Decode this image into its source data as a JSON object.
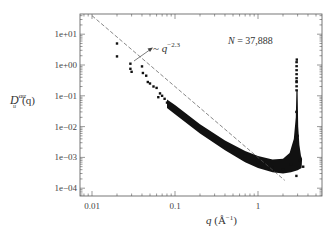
{
  "chart_data": {
    "type": "scatter",
    "title": "",
    "xlabel": "q (Å⁻¹)",
    "ylabel": "D_u^{αα}(q)",
    "xscale": "log",
    "yscale": "log",
    "xlim": [
      0.0072,
      6
    ],
    "ylim": [
      5.5e-05,
      45
    ],
    "x_ticks": [
      {
        "value": 0.01,
        "label": "0.01"
      },
      {
        "value": 0.1,
        "label": "0.1"
      },
      {
        "value": 1,
        "label": "1"
      }
    ],
    "y_ticks": [
      {
        "value": 10,
        "label": "1e+01"
      },
      {
        "value": 1,
        "label": "1e+00"
      },
      {
        "value": 0.1,
        "label": "1e-01"
      },
      {
        "value": 0.01,
        "label": "1e-02"
      },
      {
        "value": 0.001,
        "label": "1e-03"
      },
      {
        "value": 0.0001,
        "label": "1e-04"
      }
    ],
    "grid": false,
    "legend": null,
    "annotations": [
      {
        "text": "N = 37,888",
        "x": 1.0,
        "y": 9.0
      },
      {
        "text": "~ q^-2.3",
        "x": 0.05,
        "y": 3.5,
        "arrow_from": [
          0.035,
          1.6
        ]
      }
    ],
    "series": [
      {
        "name": "data",
        "style": "black markers",
        "points": [
          [
            0.02,
            5.0
          ],
          [
            0.02,
            1.9
          ],
          [
            0.029,
            1.1
          ],
          [
            0.029,
            0.75
          ],
          [
            0.03,
            0.6
          ],
          [
            0.04,
            0.9
          ],
          [
            0.041,
            0.55
          ],
          [
            0.045,
            0.45
          ],
          [
            0.047,
            0.28
          ],
          [
            0.05,
            0.25
          ],
          [
            0.055,
            0.2
          ],
          [
            0.06,
            0.18
          ],
          [
            0.063,
            0.09
          ],
          [
            0.066,
            0.12
          ],
          [
            0.07,
            0.1
          ],
          [
            0.075,
            0.08
          ],
          [
            0.08,
            0.06
          ],
          [
            0.09,
            0.05
          ],
          [
            0.1,
            0.04
          ],
          [
            0.15,
            0.015
          ],
          [
            0.2,
            0.008
          ],
          [
            0.3,
            0.004
          ],
          [
            0.5,
            0.0018
          ],
          [
            0.7,
            0.0011
          ],
          [
            1.0,
            0.0007
          ],
          [
            1.5,
            0.00045
          ],
          [
            2.0,
            0.0004
          ],
          [
            2.5,
            0.0006
          ],
          [
            2.8,
            0.003
          ],
          [
            2.9,
            0.03
          ],
          [
            2.92,
            0.3
          ],
          [
            2.93,
            1.5
          ],
          [
            3.0,
            0.005
          ],
          [
            3.2,
            0.0008
          ],
          [
            3.5,
            0.0005
          ],
          [
            2.9,
            0.00025
          ]
        ]
      },
      {
        "name": "fit ~ q^-2.3",
        "style": "dashed line",
        "exponent": -2.3,
        "points": [
          [
            0.01,
            40
          ],
          [
            2.1,
            0.00018
          ]
        ]
      }
    ]
  },
  "labels": {
    "x_axis_q": "q",
    "x_axis_unit": " (Å",
    "x_axis_exp": "−1",
    "x_axis_close": ")",
    "y_axis_D": "D",
    "y_axis_sup": "αα",
    "y_axis_sub": "u",
    "y_axis_arg": "(q)",
    "n_label_var": "N",
    "n_label_value": " = 37,888",
    "power_tilde": "~ ",
    "power_q": "q",
    "power_exp": "−2.3"
  }
}
